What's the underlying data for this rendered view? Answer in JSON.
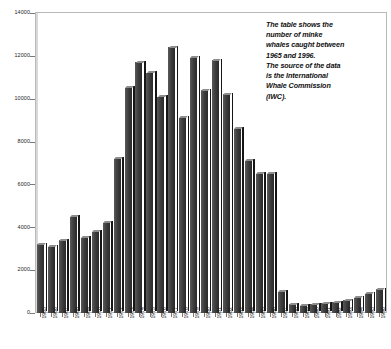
{
  "annotation": {
    "lines": [
      "The table shows the",
      "number of minke",
      "whales caught between",
      "1965 and 1996.",
      "The source of the data",
      "is the International",
      "Whale Commission",
      "(IWC)."
    ]
  },
  "colors": {
    "bar_face": "#3a3a3a",
    "bar_top": "#8d8d8d",
    "bar_side": "#161616",
    "axis": "#7a7a7a",
    "frame": "#b9b9b9",
    "background": "#ffffff",
    "text": "#111111"
  },
  "chart_data": {
    "type": "bar",
    "title": "",
    "xlabel": "",
    "ylabel": "",
    "ylim": [
      0,
      14000
    ],
    "yticks": [
      0,
      2000,
      4000,
      6000,
      8000,
      10000,
      12000,
      14000
    ],
    "ytick_labels": [
      "0",
      "2000",
      "4000",
      "6000",
      "8000",
      "10000",
      "12000",
      "14000"
    ],
    "grid": false,
    "legend": false,
    "categories": [
      "1965",
      "1966",
      "1967",
      "1968",
      "1969",
      "1970",
      "1971",
      "1972",
      "1973",
      "1974",
      "1975",
      "1976",
      "1977",
      "1978",
      "1979",
      "1980",
      "1981",
      "1982",
      "1983",
      "1984",
      "1985",
      "1986",
      "1987",
      "1988",
      "1989",
      "1990",
      "1991",
      "1992",
      "1993",
      "1994",
      "1995",
      "1996"
    ],
    "values": [
      3200,
      3100,
      3400,
      4500,
      3500,
      3800,
      4200,
      7200,
      10500,
      11700,
      11200,
      10100,
      12400,
      9100,
      11900,
      10400,
      11800,
      10200,
      8600,
      7100,
      6500,
      6500,
      1000,
      400,
      350,
      400,
      450,
      500,
      600,
      700,
      900,
      1100
    ]
  }
}
